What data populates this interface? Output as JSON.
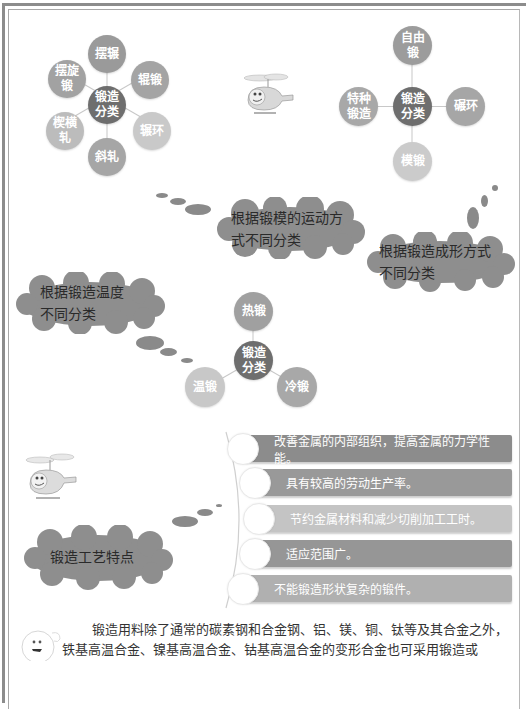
{
  "diagram_motion": {
    "center": "锻造分类",
    "nodes": [
      {
        "label": "摆辗",
        "color": "#9a9a9a"
      },
      {
        "label": "辊锻",
        "color": "#a4a4a4"
      },
      {
        "label": "辗环",
        "color": "#c9c9c9"
      },
      {
        "label": "斜轧",
        "color": "#a6a6a6"
      },
      {
        "label": "楔横轧",
        "color": "#bcbcbc"
      },
      {
        "label": "摆旋锻",
        "color": "#a2a2a2"
      }
    ],
    "center_color": "#6e6e6e"
  },
  "diagram_shaping": {
    "center": "锻造分类",
    "nodes": [
      {
        "label": "自由锻",
        "color": "#9c9c9c"
      },
      {
        "label": "碾环",
        "color": "#a6a6a6"
      },
      {
        "label": "模锻",
        "color": "#cbcbcb"
      },
      {
        "label": "特种锻造",
        "color": "#a8a8a8"
      }
    ],
    "center_color": "#6e6e6e"
  },
  "diagram_temperature": {
    "center": "锻造分类",
    "nodes": [
      {
        "label": "热锻",
        "color": "#a0a0a0"
      },
      {
        "label": "冷锻",
        "color": "#a8a8a8"
      },
      {
        "label": "温锻",
        "color": "#c8c8c8"
      }
    ],
    "center_color": "#6e6e6e"
  },
  "clouds": {
    "motion": "根据锻模的运动方式不同分类",
    "motion_lines": [
      "根据锻模的运动方",
      "式不同分类"
    ],
    "shaping_lines": [
      "根据锻造成形方式",
      "不同分类"
    ],
    "temperature_lines": [
      "根据锻造温度",
      "不同分类"
    ],
    "features": "锻造工艺特点"
  },
  "features": [
    {
      "text": "改善金属的内部组织，提高金属的力学性能。",
      "color": "#8c8c8c"
    },
    {
      "text": "具有较高的劳动生产率。",
      "color": "#999999"
    },
    {
      "text": "节约金属材料和减少切削加工工时。",
      "color": "#c4c4c4"
    },
    {
      "text": "适应范围广。",
      "color": "#969696"
    },
    {
      "text": "不能锻造形状复杂的锻件。",
      "color": "#b0b0b0"
    }
  ],
  "paragraph": {
    "line1": "锻造用料除了通常的碳素钢和合金钢、铝、镁、铜、钛等及其合金之外，",
    "line2": "铁基高温合金、镍基高温合金、钴基高温合金的变形合金也可采用锻造或"
  },
  "icons": {
    "helicopter_top": "helicopter-mascot",
    "helicopter_left": "helicopter-mascot",
    "face_bottom": "smiley-face-mascot"
  }
}
